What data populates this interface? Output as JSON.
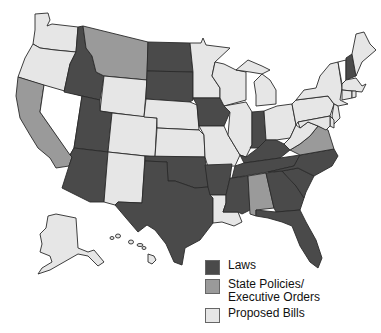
{
  "colors": {
    "laws": "#4a4a4a",
    "policies": "#9a9a9a",
    "proposed": "#e6e6e6",
    "none": "#ffffff"
  },
  "legend": {
    "items": [
      {
        "key": "laws",
        "label": "Laws",
        "color": "#4a4a4a"
      },
      {
        "key": "policies",
        "label": "State Policies/\nExecutive Orders",
        "color": "#9a9a9a"
      },
      {
        "key": "proposed",
        "label": "Proposed Bills",
        "color": "#e6e6e6"
      }
    ]
  },
  "states": {
    "WA": "proposed",
    "OR": "proposed",
    "CA": "policies",
    "NV": "none",
    "ID": "laws",
    "MT": "policies",
    "WY": "proposed",
    "UT": "laws",
    "AZ": "laws",
    "CO": "proposed",
    "NM": "proposed",
    "ND": "laws",
    "SD": "laws",
    "NE": "proposed",
    "KS": "proposed",
    "OK": "laws",
    "TX": "laws",
    "MN": "proposed",
    "IA": "laws",
    "MO": "proposed",
    "AR": "laws",
    "LA": "proposed",
    "WI": "proposed",
    "IL": "proposed",
    "MI": "proposed",
    "IN": "laws",
    "OH": "proposed",
    "KY": "laws",
    "TN": "laws",
    "MS": "laws",
    "AL": "policies",
    "GA": "laws",
    "FL": "laws",
    "SC": "laws",
    "NC": "laws",
    "VA": "policies",
    "WV": "proposed",
    "PA": "proposed",
    "NY": "proposed",
    "VT": "none",
    "NH": "laws",
    "ME": "proposed",
    "MA": "proposed",
    "CT": "proposed",
    "RI": "proposed",
    "NJ": "proposed",
    "DE": "proposed",
    "MD": "proposed",
    "AK": "proposed",
    "HI": "proposed"
  }
}
